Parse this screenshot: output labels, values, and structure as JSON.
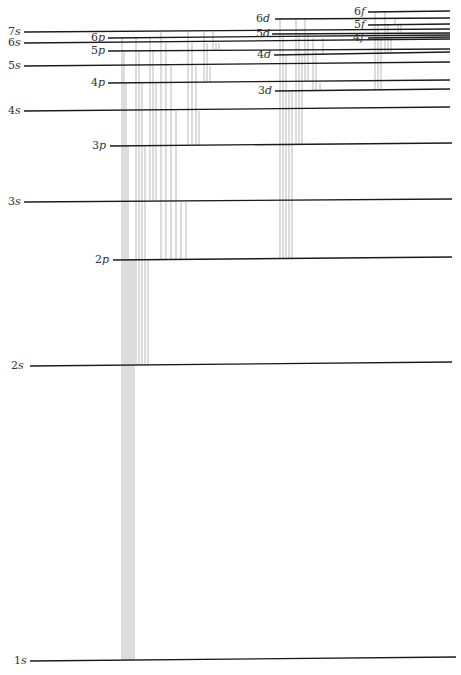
{
  "levels": [
    {
      "name": "1s",
      "n": "1",
      "l": "s",
      "x1": 30,
      "y1": 661,
      "x2": 456,
      "y2": 657,
      "lx": 14,
      "ly": 664
    },
    {
      "name": "2s",
      "n": "2",
      "l": "s",
      "x1": 30,
      "y1": 366,
      "x2": 452,
      "y2": 362,
      "lx": 11,
      "ly": 369
    },
    {
      "name": "2p",
      "n": "2",
      "l": "p",
      "x1": 113,
      "y1": 260,
      "x2": 452,
      "y2": 257,
      "lx": 95,
      "ly": 263
    },
    {
      "name": "3s",
      "n": "3",
      "l": "s",
      "x1": 24,
      "y1": 202,
      "x2": 452,
      "y2": 199,
      "lx": 8,
      "ly": 205
    },
    {
      "name": "3p",
      "n": "3",
      "l": "p",
      "x1": 110,
      "y1": 146,
      "x2": 452,
      "y2": 143,
      "lx": 92,
      "ly": 149
    },
    {
      "name": "3d",
      "n": "3",
      "l": "d",
      "x1": 275,
      "y1": 91,
      "x2": 450,
      "y2": 89,
      "lx": 258,
      "ly": 94
    },
    {
      "name": "4s",
      "n": "4",
      "l": "s",
      "x1": 24,
      "y1": 111,
      "x2": 450,
      "y2": 107,
      "lx": 8,
      "ly": 114
    },
    {
      "name": "4p",
      "n": "4",
      "l": "p",
      "x1": 108,
      "y1": 83,
      "x2": 450,
      "y2": 80,
      "lx": 91,
      "ly": 86
    },
    {
      "name": "4d",
      "n": "4",
      "l": "d",
      "x1": 274,
      "y1": 55,
      "x2": 450,
      "y2": 52,
      "lx": 257,
      "ly": 58
    },
    {
      "name": "4f",
      "n": "4",
      "l": "f",
      "x1": 368,
      "y1": 38,
      "x2": 450,
      "y2": 37,
      "lx": 353,
      "ly": 41
    },
    {
      "name": "5s",
      "n": "5",
      "l": "s",
      "x1": 24,
      "y1": 66,
      "x2": 450,
      "y2": 62,
      "lx": 8,
      "ly": 69
    },
    {
      "name": "5p",
      "n": "5",
      "l": "p",
      "x1": 108,
      "y1": 51,
      "x2": 450,
      "y2": 49,
      "lx": 91,
      "ly": 54
    },
    {
      "name": "5d",
      "n": "5",
      "l": "d",
      "x1": 272,
      "y1": 34,
      "x2": 450,
      "y2": 33,
      "lx": 256,
      "ly": 37
    },
    {
      "name": "5f",
      "n": "5",
      "l": "f",
      "x1": 368,
      "y1": 25,
      "x2": 450,
      "y2": 24,
      "lx": 354,
      "ly": 28
    },
    {
      "name": "6s",
      "n": "6",
      "l": "s",
      "x1": 24,
      "y1": 43,
      "x2": 450,
      "y2": 39,
      "lx": 8,
      "ly": 46
    },
    {
      "name": "6p",
      "n": "6",
      "l": "p",
      "x1": 108,
      "y1": 38,
      "x2": 450,
      "y2": 35,
      "lx": 91,
      "ly": 41
    },
    {
      "name": "6d",
      "n": "6",
      "l": "d",
      "x1": 275,
      "y1": 19,
      "x2": 450,
      "y2": 18,
      "lx": 256,
      "ly": 22
    },
    {
      "name": "6f",
      "n": "6",
      "l": "f",
      "x1": 368,
      "y1": 12,
      "x2": 450,
      "y2": 11,
      "lx": 354,
      "ly": 15
    },
    {
      "name": "7s",
      "n": "7",
      "l": "s",
      "x1": 24,
      "y1": 32,
      "x2": 450,
      "y2": 29,
      "lx": 8,
      "ly": 35
    }
  ],
  "transitions": {
    "p_to_1s": {
      "xs": [
        122,
        124,
        126,
        128,
        130,
        132,
        134
      ],
      "y_top": [
        38,
        51,
        83,
        146,
        260,
        260,
        260
      ],
      "y_bottom": 660
    },
    "p_to_2s": {
      "xs": [
        136,
        139,
        142,
        145,
        148
      ],
      "y_top": [
        38,
        51,
        83,
        146,
        260
      ],
      "y_bottom": 365
    },
    "p_to_3s": {
      "xs": [
        150,
        153,
        156
      ],
      "y_top": [
        38,
        51,
        83
      ],
      "y_bottom": 200
    },
    "s_to_2p": {
      "xs": [
        161,
        166,
        171,
        176,
        181,
        186
      ],
      "y_top": [
        32,
        43,
        66,
        111,
        202,
        202
      ],
      "y_bottom": 259
    },
    "d_to_2p": {
      "xs": [
        280,
        283,
        286,
        289,
        292
      ],
      "y_top": [
        19,
        34,
        55,
        91,
        91
      ],
      "y_bottom": 258
    },
    "s_to_3p": {
      "xs": [
        188,
        192,
        196,
        199
      ],
      "y_top": [
        32,
        43,
        66,
        111
      ],
      "y_bottom": 145
    },
    "d_to_3p": {
      "xs": [
        296,
        299,
        302
      ],
      "y_top": [
        19,
        34,
        55
      ],
      "y_bottom": 144
    },
    "s_to_4p": {
      "xs": [
        204,
        207,
        210
      ],
      "y_top": [
        32,
        43,
        66
      ],
      "y_bottom": 82
    },
    "d_to_4p": {
      "xs": [
        305,
        308
      ],
      "y_top": [
        19,
        34
      ],
      "y_bottom": 81
    },
    "f_to_3d": {
      "xs": [
        375,
        378,
        381
      ],
      "y_top": [
        12,
        25,
        38
      ],
      "y_bottom": 90
    },
    "f_to_4d": {
      "xs": [
        385,
        388,
        391
      ],
      "y_top": [
        12,
        25,
        38
      ],
      "y_bottom": 53
    },
    "p_to_3d": {
      "xs": [
        313,
        316,
        320
      ],
      "y_top": [
        38,
        51,
        83
      ],
      "y_bottom": 90
    },
    "p_to_4d": {
      "xs": [
        323
      ],
      "y_top": [
        38
      ],
      "y_bottom": 54
    },
    "d_to_5f": {
      "xs": [
        395,
        398,
        401
      ],
      "y_top": [
        19,
        34,
        34
      ],
      "y_bottom": 25
    },
    "s_to_5p": {
      "xs": [
        213,
        216,
        219
      ],
      "y_top": [
        32,
        43,
        43
      ],
      "y_bottom": 50
    }
  }
}
